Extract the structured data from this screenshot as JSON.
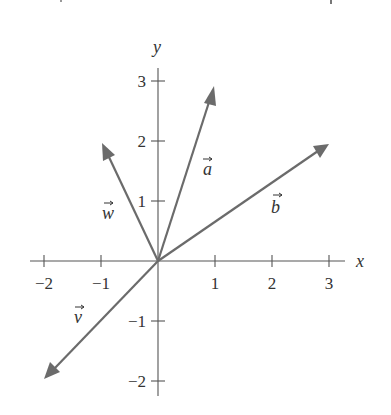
{
  "figure": {
    "title": "",
    "axes": {
      "x_label": "x",
      "y_label": "y",
      "x_ticks": [
        {
          "value": -2,
          "label": "−2"
        },
        {
          "value": -1,
          "label": "−1"
        },
        {
          "value": 1,
          "label": "1"
        },
        {
          "value": 2,
          "label": "2"
        },
        {
          "value": 3,
          "label": "3"
        }
      ],
      "y_ticks": [
        {
          "value": 3,
          "label": "3"
        },
        {
          "value": 2,
          "label": "2"
        },
        {
          "value": 1,
          "label": "1"
        },
        {
          "value": -1,
          "label": "−1"
        },
        {
          "value": -2,
          "label": "−2"
        }
      ],
      "x_range": [
        -2.2,
        3.3
      ],
      "y_range": [
        -2.2,
        3.2
      ]
    },
    "vectors": [
      {
        "name": "a",
        "label": "a",
        "tail": [
          0,
          0
        ],
        "head": [
          1,
          3
        ]
      },
      {
        "name": "b",
        "label": "b",
        "tail": [
          0,
          0
        ],
        "head": [
          3,
          2
        ]
      },
      {
        "name": "w",
        "label": "w",
        "tail": [
          0,
          0
        ],
        "head": [
          -1,
          2
        ]
      },
      {
        "name": "v",
        "label": "v",
        "tail": [
          0,
          0
        ],
        "head": [
          -2,
          -2
        ]
      }
    ],
    "colors": {
      "axis": "#555555",
      "vector": "#6b6b6b",
      "text": "#333333",
      "background": "#ffffff"
    }
  }
}
